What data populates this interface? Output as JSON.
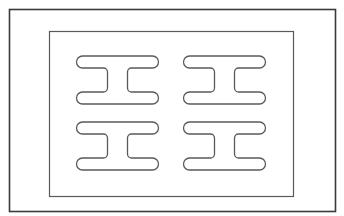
{
  "diagram": {
    "colors": {
      "background": "#ffffff",
      "outer_frame_stroke": "#3a3a3a",
      "inner_frame_stroke": "#5a5a5a",
      "shape_stroke": "#5a5a5a"
    },
    "outer_frame": {
      "x": 9,
      "y": 9,
      "width": 326,
      "height": 202
    },
    "inner_frame": {
      "x": 49,
      "y": 31,
      "width": 244,
      "height": 165
    },
    "shapes": [
      {
        "id": "i-beam-top-left",
        "x": 76,
        "y": 56
      },
      {
        "id": "i-beam-top-right",
        "x": 183,
        "y": 56
      },
      {
        "id": "i-beam-bottom-left",
        "x": 76,
        "y": 122
      },
      {
        "id": "i-beam-bottom-right",
        "x": 183,
        "y": 122
      }
    ]
  }
}
